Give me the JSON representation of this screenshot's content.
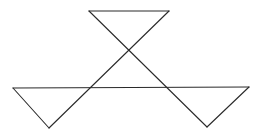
{
  "diagram": {
    "stroke_color": "#2a2a2a",
    "background": "#ffffff",
    "lines": [
      {
        "id": "top-edge",
        "x1": 89,
        "y1": 11,
        "x2": 169,
        "y2": 11
      },
      {
        "id": "diagonal-left-to-right",
        "x1": 89,
        "y1": 11,
        "x2": 207,
        "y2": 127
      },
      {
        "id": "diagonal-right-to-left",
        "x1": 169,
        "y1": 11,
        "x2": 49,
        "y2": 128
      },
      {
        "id": "middle-horizontal",
        "x1": 13,
        "y1": 88,
        "x2": 249,
        "y2": 87
      },
      {
        "id": "left-outer-edge",
        "x1": 13,
        "y1": 88,
        "x2": 49,
        "y2": 128
      },
      {
        "id": "right-outer-edge",
        "x1": 249,
        "y1": 87,
        "x2": 207,
        "y2": 127
      }
    ]
  }
}
